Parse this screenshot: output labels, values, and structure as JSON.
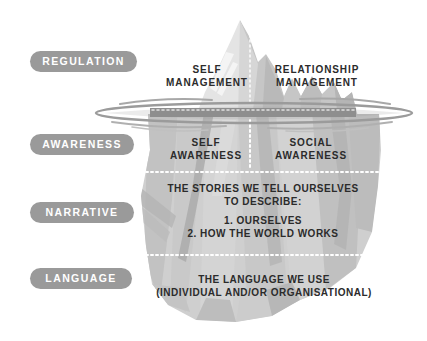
{
  "diagram": {
    "type": "iceberg-model",
    "colors": {
      "pill_background": "#9a9a9a",
      "pill_text": "#ffffff",
      "berg_above_water": "#e3e3e3",
      "berg_below_water": "#c9c9c9",
      "berg_shadow_facet": "#a9a9a9",
      "waterline": "#8c8c8c",
      "body_text": "#2b2b2b",
      "background": "#ffffff",
      "divider": "#ffffff"
    }
  },
  "pills": [
    {
      "id": "regulation",
      "label": "REGULATION"
    },
    {
      "id": "awareness",
      "label": "AWARENESS"
    },
    {
      "id": "narrative",
      "label": "NARRATIVE"
    },
    {
      "id": "language",
      "label": "LANGUAGE"
    }
  ],
  "above_water": {
    "left": {
      "line1": "SELF",
      "line2": "MANAGEMENT"
    },
    "right": {
      "line1": "RELATIONSHIP",
      "line2": "MANAGEMENT"
    }
  },
  "awareness_band": {
    "left": {
      "line1": "SELF",
      "line2": "AWARENESS"
    },
    "right": {
      "line1": "SOCIAL",
      "line2": "AWARENESS"
    }
  },
  "narrative_band": {
    "line1": "THE STORIES WE TELL OURSELVES",
    "line2": "TO DESCRIBE:",
    "item1": "1. OURSELVES",
    "item2": "2. HOW THE WORLD WORKS"
  },
  "language_band": {
    "line1": "THE LANGUAGE WE USE",
    "line2": "(INDIVIDUAL AND/OR ORGANISATIONAL)"
  }
}
